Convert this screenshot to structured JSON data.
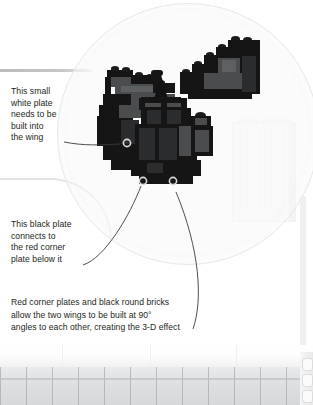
{
  "scene": {
    "subject": "lego-model-photo-with-callouts",
    "background_color": "#ffffff",
    "text_color": "#231f20",
    "highlight_circle_color": "#e6e7e8",
    "leader_line_color": "#3a3a3a"
  },
  "callouts": [
    {
      "id": "callout-white-plate",
      "text": "This small\nwhite plate\nneeds to be\nbuilt into\nthe wing",
      "marker_label": "white-plate-marker"
    },
    {
      "id": "callout-black-plate",
      "text": "This black plate\nconnects to\nthe red corner\nplate below it",
      "marker_label": "black-plate-marker"
    },
    {
      "id": "callout-red-corner-plates",
      "text": "Red corner plates and black round bricks\nallow the two wings to be built at 90°\nangles to each other, creating the 3-D effect",
      "marker_label": "red-corner-plate-marker"
    }
  ],
  "model": {
    "left_wing_label": "left-wing-assembly",
    "body_label": "central-body-assembly",
    "nose_cone_label": "black-cone-piece",
    "right_wing_label": "detached-right-wing",
    "colors": {
      "black": "#151515",
      "dark_gray": "#4a4c4e",
      "mid_gray": "#5d6062",
      "shadow_gray": "#2a2c2e"
    }
  },
  "background": {
    "panel_label": "white-lego-panel",
    "baseplate_label": "white-baseplate-row",
    "shelf_line_label": "background-shelf-edge"
  }
}
